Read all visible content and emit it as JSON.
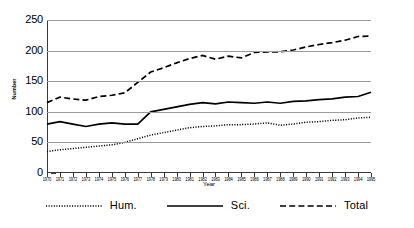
{
  "chart_data": {
    "type": "line",
    "title": "",
    "xlabel": "Year",
    "ylabel": "Number",
    "ylim": [
      0,
      250
    ],
    "yticks": [
      0,
      50,
      100,
      150,
      200,
      250
    ],
    "grid": true,
    "legend_position": "bottom",
    "categories": [
      "1970",
      "1971",
      "1972",
      "1973",
      "1974",
      "1975",
      "1976",
      "1977",
      "1978",
      "1979",
      "1980",
      "1981",
      "1982",
      "1983",
      "1984",
      "1985",
      "1986",
      "1987",
      "1988",
      "1989",
      "1990",
      "1991",
      "1992",
      "1993",
      "1994",
      "1995"
    ],
    "series": [
      {
        "name": "Hum.",
        "style": "dotted",
        "values": [
          35,
          38,
          40,
          42,
          44,
          46,
          50,
          56,
          62,
          66,
          70,
          74,
          76,
          77,
          79,
          79,
          80,
          82,
          78,
          80,
          83,
          84,
          86,
          87,
          90,
          91
        ]
      },
      {
        "name": "Sci.",
        "style": "solid",
        "values": [
          80,
          84,
          80,
          76,
          80,
          82,
          80,
          80,
          100,
          104,
          108,
          112,
          115,
          113,
          116,
          115,
          114,
          116,
          114,
          117,
          118,
          120,
          121,
          124,
          125,
          132
        ]
      },
      {
        "name": "Total",
        "style": "dashed",
        "values": [
          115,
          124,
          121,
          119,
          125,
          127,
          131,
          148,
          165,
          172,
          180,
          187,
          192,
          186,
          191,
          188,
          197,
          198,
          198,
          201,
          206,
          210,
          213,
          217,
          223,
          224
        ]
      }
    ]
  },
  "legend": {
    "items": [
      {
        "label": "Hum.",
        "style": "dotted"
      },
      {
        "label": "Sci.",
        "style": "solid"
      },
      {
        "label": "Total",
        "style": "dashed"
      }
    ]
  },
  "axis": {
    "x_title": "Year",
    "y_title": "Number"
  },
  "colors": {
    "line": "#000000",
    "grid": "#9a9a9a",
    "axis": "#3a3a3a",
    "background": "#ffffff"
  }
}
